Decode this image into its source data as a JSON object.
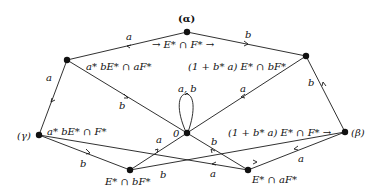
{
  "diagram": {
    "type": "automaton",
    "nodes": {
      "alpha": {
        "label": "(α)",
        "state_label": "→ E* ∩ F* →"
      },
      "top_left": {
        "state_label": "a* bE* ∩ aF*"
      },
      "top_right": {
        "state_label": "(1 + b* a) E* ∩ bF*"
      },
      "gamma": {
        "label": "(γ)",
        "state_label": "a* bE* ∩ F*"
      },
      "zero": {
        "label": "0"
      },
      "beta": {
        "label": "(β)",
        "state_label": "(1 + b* a) E* ∩ F* →"
      },
      "bottom_left": {
        "state_label": "E* ∩ bF*"
      },
      "bottom_right": {
        "state_label": "E* ∩ aF*"
      }
    },
    "edge_labels": {
      "alpha_to_tl": "a",
      "alpha_to_tr": "b",
      "tl_to_gamma": "a",
      "tl_to_zero": "b",
      "tr_to_zero": "a",
      "tr_to_beta": "b",
      "zero_loop": "a, b",
      "gamma_to_bl": "b",
      "bl_to_zero": "a",
      "bl_to_beta": "b",
      "beta_to_br": "a",
      "br_to_zero": "b",
      "br_to_gamma": "a"
    }
  }
}
